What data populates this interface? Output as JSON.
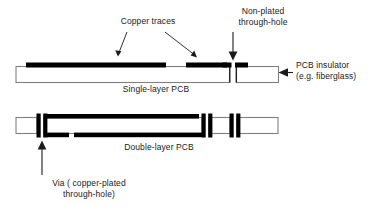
{
  "diagram": {
    "colors": {
      "copper": "#000000",
      "insulator_fill": "#ffffff",
      "insulator_stroke": "#808080",
      "text": "#1a1a1a",
      "leader": "#1a1a1a"
    },
    "labels": {
      "copper_traces": "Copper traces",
      "non_plated_line1": "Non-plated",
      "non_plated_line2": "through-hole",
      "insulator_line1": "PCB insulator",
      "insulator_line2": "(e.g. fiberglass)",
      "caption_single": "Single-layer PCB",
      "caption_double": "Double-layer PCB",
      "via_line1": "Via ( copper-plated",
      "via_line2": "through-hole)"
    },
    "boards": [
      {
        "name": "single-layer-pcb",
        "caption": "Single-layer PCB",
        "features": [
          "copper trace long top-left",
          "copper trace short top-middle",
          "copper pad left of hole",
          "copper pad right of hole",
          "non-plated through-hole gap"
        ]
      },
      {
        "name": "double-layer-pcb",
        "caption": "Double-layer PCB",
        "features": [
          "plated via left",
          "plated via middle-right",
          "plated via right",
          "copper trace top",
          "copper trace bottom"
        ]
      }
    ]
  }
}
